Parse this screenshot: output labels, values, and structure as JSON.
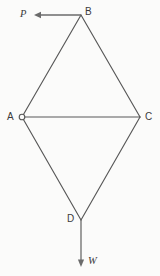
{
  "figure": {
    "background_color": "#fbfbfa",
    "line_color": "#585858",
    "force_color": "#6b6b6b",
    "label_color": "#3a3a3a",
    "vertices": [
      {
        "id": "A",
        "label": "A",
        "x": 22,
        "y": 117,
        "support": "pin"
      },
      {
        "id": "B",
        "label": "B",
        "x": 81,
        "y": 15,
        "support": "none"
      },
      {
        "id": "C",
        "label": "C",
        "x": 140,
        "y": 117,
        "support": "none"
      },
      {
        "id": "D",
        "label": "D",
        "x": 81,
        "y": 220,
        "support": "none"
      }
    ],
    "members": [
      {
        "id": "AB",
        "from": "A",
        "to": "B"
      },
      {
        "id": "BC",
        "from": "B",
        "to": "C"
      },
      {
        "id": "AC",
        "from": "A",
        "to": "C"
      },
      {
        "id": "AD",
        "from": "A",
        "to": "D"
      },
      {
        "id": "CD",
        "from": "C",
        "to": "D"
      }
    ],
    "forces": [
      {
        "id": "P",
        "label": "P",
        "at_vertex": "B",
        "direction": "left",
        "tail_x": 81,
        "tail_y": 15,
        "head_x": 35,
        "head_y": 15
      },
      {
        "id": "W",
        "label": "W",
        "at_vertex": "D",
        "direction": "down",
        "tail_x": 81,
        "tail_y": 220,
        "head_x": 81,
        "head_y": 266
      }
    ],
    "support_marker": {
      "vertex": "A",
      "shape": "circle",
      "radius": 2.8
    }
  }
}
